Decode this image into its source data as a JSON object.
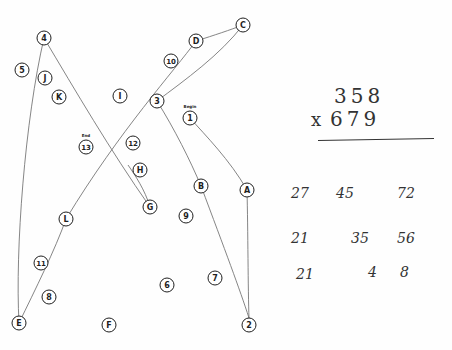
{
  "document": {
    "type": "Trail Making Test sheet (scanned) with handwritten multiplication"
  },
  "trail_nodes": [
    {
      "label": "4",
      "x": 44,
      "y": 38
    },
    {
      "label": "5",
      "x": 22,
      "y": 70
    },
    {
      "label": "J",
      "x": 45,
      "y": 78
    },
    {
      "label": "K",
      "x": 59,
      "y": 97
    },
    {
      "label": "I",
      "x": 120,
      "y": 96
    },
    {
      "label": "D",
      "x": 196,
      "y": 41
    },
    {
      "label": "C",
      "x": 243,
      "y": 25
    },
    {
      "label": "10",
      "x": 171,
      "y": 61
    },
    {
      "label": "3",
      "x": 157,
      "y": 101
    },
    {
      "label": "1",
      "x": 190,
      "y": 118
    },
    {
      "label": "13",
      "x": 86,
      "y": 147
    },
    {
      "label": "12",
      "x": 133,
      "y": 143
    },
    {
      "label": "H",
      "x": 140,
      "y": 170
    },
    {
      "label": "B",
      "x": 201,
      "y": 186
    },
    {
      "label": "A",
      "x": 247,
      "y": 190
    },
    {
      "label": "G",
      "x": 150,
      "y": 207
    },
    {
      "label": "9",
      "x": 186,
      "y": 216
    },
    {
      "label": "L",
      "x": 66,
      "y": 219
    },
    {
      "label": "11",
      "x": 41,
      "y": 263
    },
    {
      "label": "8",
      "x": 49,
      "y": 297
    },
    {
      "label": "6",
      "x": 167,
      "y": 285
    },
    {
      "label": "7",
      "x": 215,
      "y": 278
    },
    {
      "label": "E",
      "x": 19,
      "y": 323
    },
    {
      "label": "F",
      "x": 109,
      "y": 325
    },
    {
      "label": "2",
      "x": 249,
      "y": 325
    }
  ],
  "node_annotations": {
    "begin": "Begin",
    "end": "End"
  },
  "trail_paths": [
    "M190,118 C205,135 230,160 247,190",
    "M247,190 C248,230 248,290 249,318",
    "M249,318 C240,290 225,250 201,186",
    "M201,186 C190,160 175,130 157,101",
    "M157,101 C185,80 220,55 243,25",
    "M243,25 C230,30 215,35 196,41",
    "M196,41 C175,70 120,130 66,219",
    "M66,219 C55,250 35,290 19,323",
    "M19,323 C15,250 25,120 44,38",
    "M44,38 C75,90 110,150 150,207",
    "M150,207 C145,190 135,175 128,165"
  ],
  "multiplication": {
    "multiplicand": "358",
    "multiplier": "679",
    "operator": "x",
    "partial_rows": [
      [
        "27",
        "45",
        "72"
      ],
      [
        "21",
        "35",
        "56"
      ],
      [
        "21",
        "4",
        "8"
      ]
    ]
  },
  "colors": {
    "ink": "#1f1f1f",
    "pencil": "#6a6a6a",
    "paper": "#fefefe"
  }
}
